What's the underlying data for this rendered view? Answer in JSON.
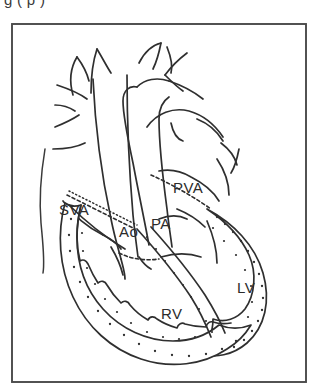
{
  "figure": {
    "caption_partial": "g (                 p  )",
    "panel_border_color": "#4a4a4a",
    "ink_color": "#2f2f2f",
    "background_color": "#ffffff",
    "diagram_type": "line-drawing anatomical schematic"
  },
  "labels": {
    "sva": "SVA",
    "ao": "Ao",
    "pa": "PA",
    "pva": "PVA",
    "rv": "RV",
    "lv": "LV"
  },
  "label_positions": {
    "sva": {
      "x": 48,
      "y": 192
    },
    "ao": {
      "x": 108,
      "y": 203
    },
    "pa": {
      "x": 140,
      "y": 196
    },
    "pva": {
      "x": 162,
      "y": 170
    },
    "rv": {
      "x": 150,
      "y": 296
    },
    "lv": {
      "x": 226,
      "y": 270
    }
  },
  "structures": [
    {
      "name": "systemic-venous-atrium",
      "abbr": "SVA",
      "wall": "plain"
    },
    {
      "name": "aorta",
      "abbr": "Ao",
      "wall": "plain"
    },
    {
      "name": "pulmonary-artery",
      "abbr": "PA",
      "wall": "plain"
    },
    {
      "name": "pulmonary-venous-atrium",
      "abbr": "PVA",
      "wall": "plain"
    },
    {
      "name": "right-ventricle",
      "abbr": "RV",
      "wall": "stippled-trabeculated"
    },
    {
      "name": "left-ventricle",
      "abbr": "LV",
      "wall": "stippled-smooth"
    }
  ]
}
